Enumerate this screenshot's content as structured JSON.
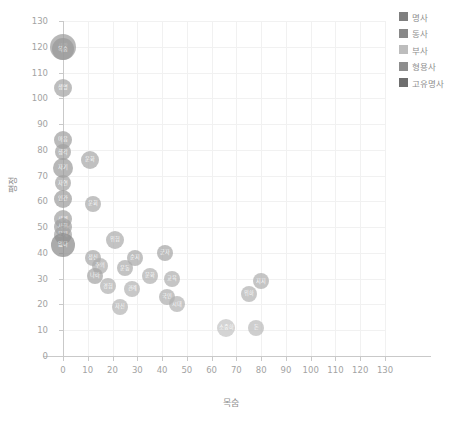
{
  "chart_data": {
    "type": "scatter",
    "title": "",
    "xlabel": "목숨",
    "ylabel": "평정",
    "xlim": [
      0,
      130
    ],
    "ylim": [
      0,
      130
    ],
    "xticks": [
      "0",
      "10",
      "20",
      "30",
      "40",
      "50",
      "60",
      "70",
      "80",
      "90",
      "100",
      "110",
      "120",
      "130"
    ],
    "yticks": [
      "0",
      "10",
      "20",
      "30",
      "40",
      "50",
      "60",
      "70",
      "80",
      "90",
      "100",
      "110",
      "120",
      "130"
    ],
    "grid": true,
    "legend_position": "right",
    "legend": [
      {
        "label": "명사",
        "color": "#7f7f7f"
      },
      {
        "label": "동사",
        "color": "#888888"
      },
      {
        "label": "부사",
        "color": "#bdbdbd"
      },
      {
        "label": "형용사",
        "color": "#8e8e8e"
      },
      {
        "label": "고유명사",
        "color": "#6e6e6e"
      }
    ],
    "points": [
      {
        "label": "사람",
        "x": 0,
        "y": 120,
        "r": 13,
        "color": "#9e9e9e",
        "cat": "명사"
      },
      {
        "label": "목숨",
        "x": 0,
        "y": 119,
        "r": 11,
        "color": "#9a9a9a",
        "cat": "명사"
      },
      {
        "label": "생명",
        "x": 0,
        "y": 104,
        "r": 9,
        "color": "#a5a5a5",
        "cat": "명사"
      },
      {
        "label": "마음",
        "x": 0,
        "y": 84,
        "r": 9,
        "color": "#a0a0a0",
        "cat": "명사"
      },
      {
        "label": "생각",
        "x": 0,
        "y": 79,
        "r": 8,
        "color": "#a2a2a2",
        "cat": "명사"
      },
      {
        "label": "운화",
        "x": 11,
        "y": 76,
        "r": 9,
        "color": "#a8a8a8",
        "cat": "명사"
      },
      {
        "label": "자기",
        "x": 0,
        "y": 73,
        "r": 10,
        "color": "#9c9c9c",
        "cat": "명사"
      },
      {
        "label": "자연",
        "x": 0,
        "y": 67,
        "r": 8,
        "color": "#a4a4a4",
        "cat": "명사"
      },
      {
        "label": "인간",
        "x": 0,
        "y": 61,
        "r": 9,
        "color": "#9d9d9d",
        "cat": "명사"
      },
      {
        "label": "운회",
        "x": 12,
        "y": 59,
        "r": 8,
        "color": "#ababab",
        "cat": "명사"
      },
      {
        "label": "세계",
        "x": 0,
        "y": 53,
        "r": 9,
        "color": "#a1a1a1",
        "cat": "명사"
      },
      {
        "label": "사회",
        "x": 0,
        "y": 50,
        "r": 9,
        "color": "#9f9f9f",
        "cat": "명사"
      },
      {
        "label": "문제",
        "x": 0,
        "y": 47,
        "r": 9,
        "color": "#a3a3a3",
        "cat": "명사"
      },
      {
        "label": "없다",
        "x": 0,
        "y": 43,
        "r": 12,
        "color": "#8b8b8b",
        "cat": "형용사"
      },
      {
        "label": "위험",
        "x": 21,
        "y": 45,
        "r": 9,
        "color": "#acacac",
        "cat": "명사"
      },
      {
        "label": "정신",
        "x": 12,
        "y": 38,
        "r": 8,
        "color": "#a9a9a9",
        "cat": "명사"
      },
      {
        "label": "순지",
        "x": 29,
        "y": 38,
        "r": 8,
        "color": "#aaaaaa",
        "cat": "명사"
      },
      {
        "label": "군자",
        "x": 41,
        "y": 40,
        "r": 8,
        "color": "#a7a7a7",
        "cat": "명사"
      },
      {
        "label": "주의",
        "x": 15,
        "y": 35,
        "r": 8,
        "color": "#aeaeae",
        "cat": "명사"
      },
      {
        "label": "운동",
        "x": 25,
        "y": 34,
        "r": 8,
        "color": "#adadad",
        "cat": "명사"
      },
      {
        "label": "지지",
        "x": 80,
        "y": 29,
        "r": 8,
        "color": "#b0b0b0",
        "cat": "명사"
      },
      {
        "label": "나라",
        "x": 13,
        "y": 31,
        "r": 8,
        "color": "#a6a6a6",
        "cat": "명사"
      },
      {
        "label": "문화",
        "x": 35,
        "y": 31,
        "r": 8,
        "color": "#b1b1b1",
        "cat": "명사"
      },
      {
        "label": "교육",
        "x": 44,
        "y": 30,
        "r": 8,
        "color": "#afafaf",
        "cat": "명사"
      },
      {
        "label": "경험",
        "x": 18,
        "y": 27,
        "r": 8,
        "color": "#b2b2b2",
        "cat": "명사"
      },
      {
        "label": "관계",
        "x": 28,
        "y": 26,
        "r": 8,
        "color": "#b3b3b3",
        "cat": "명사"
      },
      {
        "label": "위하",
        "x": 75,
        "y": 24,
        "r": 8,
        "color": "#b4b4b4",
        "cat": "동사"
      },
      {
        "label": "국민",
        "x": 42,
        "y": 23,
        "r": 8,
        "color": "#b0b0b0",
        "cat": "명사"
      },
      {
        "label": "자신",
        "x": 23,
        "y": 19,
        "r": 8,
        "color": "#b5b5b5",
        "cat": "명사"
      },
      {
        "label": "시대",
        "x": 46,
        "y": 20,
        "r": 8,
        "color": "#b3b3b3",
        "cat": "명사"
      },
      {
        "label": "소중하",
        "x": 66,
        "y": 11,
        "r": 9,
        "color": "#c4c4c4",
        "cat": "형용사"
      },
      {
        "label": "돈",
        "x": 78,
        "y": 11,
        "r": 8,
        "color": "#bcbcbc",
        "cat": "명사"
      }
    ]
  }
}
